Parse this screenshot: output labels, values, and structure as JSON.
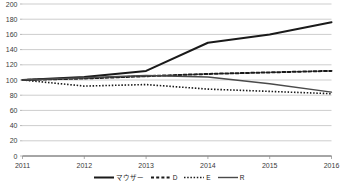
{
  "chart_data": {
    "type": "line",
    "title": "",
    "xlabel": "",
    "ylabel": "",
    "x": [
      2011,
      2012,
      2013,
      2014,
      2015,
      2016
    ],
    "categories": [
      "2011",
      "2012",
      "2013",
      "2014",
      "2015",
      "2016"
    ],
    "xlim": [
      2011,
      2016
    ],
    "ylim": [
      0,
      200
    ],
    "yticks": [
      0,
      20,
      40,
      60,
      80,
      100,
      120,
      140,
      160,
      180,
      200
    ],
    "ytick_labels": [
      "0",
      "20",
      "40",
      "60",
      "80",
      "100",
      "120",
      "140",
      "160",
      "180",
      "200"
    ],
    "xtick_labels": [
      "2011",
      "2012",
      "2013",
      "2014",
      "2015",
      "2016"
    ],
    "grid": true,
    "grid_axis": "y",
    "legend_position": "bottom",
    "series": [
      {
        "name": "マウザー",
        "style": "solid",
        "color": "#1a1a1a",
        "width": 2.0,
        "values": [
          100,
          104,
          112,
          149,
          160,
          176
        ]
      },
      {
        "name": "D",
        "style": "dashed",
        "color": "#1a1a1a",
        "width": 2.0,
        "values": [
          100,
          102,
          105,
          108,
          110,
          112
        ]
      },
      {
        "name": "E",
        "style": "dotted",
        "color": "#1a1a1a",
        "width": 1.6,
        "values": [
          100,
          92,
          94,
          88,
          85,
          82
        ]
      },
      {
        "name": "R",
        "style": "solid",
        "color": "#4a4a4a",
        "width": 1.4,
        "values": [
          100,
          103,
          106,
          104,
          95,
          84
        ]
      }
    ]
  },
  "legend": {
    "items": [
      {
        "label": "マウザー",
        "style": "solid"
      },
      {
        "label": "D",
        "style": "dashed"
      },
      {
        "label": "E",
        "style": "dotted"
      },
      {
        "label": "R",
        "style": "solid"
      }
    ]
  }
}
